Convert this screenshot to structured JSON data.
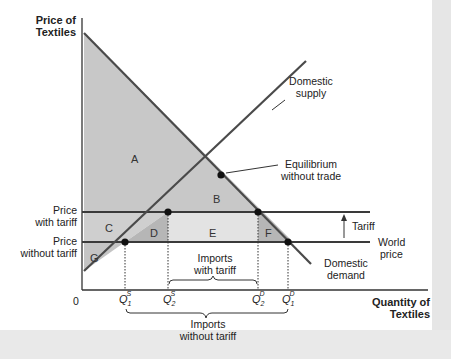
{
  "axes": {
    "y_label_line1": "Price of",
    "y_label_line2": "Textiles",
    "x_label_line1": "Quantity of",
    "x_label_line2": "Textiles",
    "origin": "0"
  },
  "curves": {
    "supply_line1": "Domestic",
    "supply_line2": "supply",
    "demand_line1": "Domestic",
    "demand_line2": "demand"
  },
  "price_lines": {
    "with_tariff_line1": "Price",
    "with_tariff_line2": "with tariff",
    "without_tariff_line1": "Price",
    "without_tariff_line2": "without tariff",
    "world_line1": "World",
    "world_line2": "price",
    "tariff": "Tariff"
  },
  "annotations": {
    "equilibrium_line1": "Equilibrium",
    "equilibrium_line2": "without trade",
    "imports_with_tariff_line1": "Imports",
    "imports_with_tariff_line2": "with tariff",
    "imports_without_tariff_line1": "Imports",
    "imports_without_tariff_line2": "without tariff"
  },
  "areas": [
    "A",
    "B",
    "C",
    "D",
    "E",
    "F",
    "G"
  ],
  "quantities": {
    "q1s": {
      "base": "Q",
      "sub": "1",
      "sup": "S"
    },
    "q2s": {
      "base": "Q",
      "sub": "2",
      "sup": "S"
    },
    "q2d": {
      "base": "Q",
      "sub": "2",
      "sup": "D"
    },
    "q1d": {
      "base": "Q",
      "sub": "1",
      "sup": "D"
    }
  },
  "colors": {
    "shade_light": "#d9d9d9",
    "shade_mid": "#c4c4c4",
    "shade_dark": "#b0b0b0",
    "line": "#4a4a4a",
    "price_line": "#3a3a3a"
  }
}
